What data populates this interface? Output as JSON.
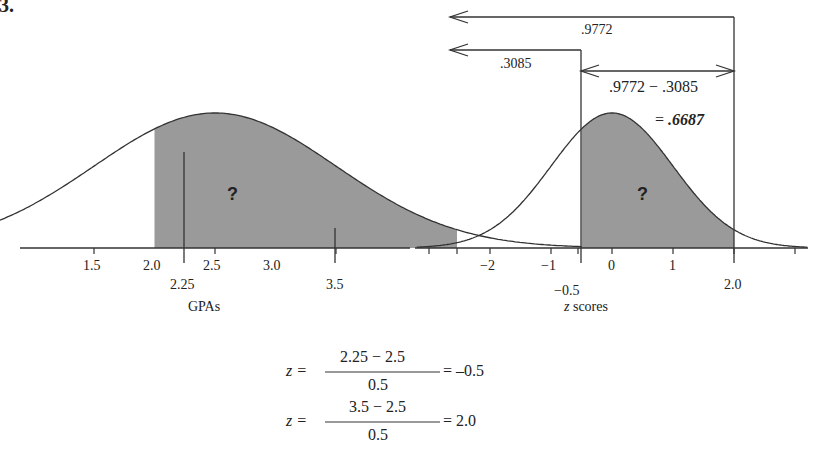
{
  "figure": {
    "label": "6.3.",
    "left_panel": {
      "axis_label": "GPAs",
      "tick_labels": [
        "1.5",
        "2.0",
        "2.5",
        "3.0"
      ],
      "boundary_labels": [
        "2.25",
        "3.5"
      ],
      "region_label": "?"
    },
    "right_panel": {
      "axis_label_var": "z",
      "axis_label_rest": " scores",
      "tick_labels": [
        "−2",
        "−1",
        "0",
        "1"
      ],
      "boundary_labels": [
        "−0.5",
        "2.0"
      ],
      "region_label": "?",
      "arrow_upper_label": ".9772",
      "arrow_lower_label": ".3085",
      "difference_label": ".9772 − .3085",
      "result_prefix": "= ",
      "result_value": ".6687"
    },
    "equations": [
      {
        "lhs": "z =",
        "numerator": "2.25 − 2.5",
        "denominator": "0.5",
        "rhs": "= –0.5"
      },
      {
        "lhs": "z =",
        "numerator": "3.5 − 2.5",
        "denominator": "0.5",
        "rhs": "= 2.0"
      }
    ],
    "colors": {
      "shade": "#9a9a9a",
      "line": "#333333"
    }
  },
  "chart_data": {
    "type": "area",
    "panels": [
      {
        "xlabel": "GPAs",
        "mean": 2.5,
        "sd": 0.5,
        "ticks": [
          1.0,
          1.5,
          2.0,
          2.5,
          3.0,
          3.5,
          4.0
        ],
        "shaded_range": [
          2.25,
          3.5
        ],
        "annotation": "?"
      },
      {
        "xlabel": "z scores",
        "mean": 0,
        "sd": 1,
        "ticks": [
          -3,
          -2,
          -1,
          0,
          1,
          2,
          3
        ],
        "shaded_range": [
          -0.5,
          2.0
        ],
        "cumulative": {
          "-0.5": 0.3085,
          "2.0": 0.9772
        },
        "shaded_area": 0.6687
      }
    ]
  }
}
